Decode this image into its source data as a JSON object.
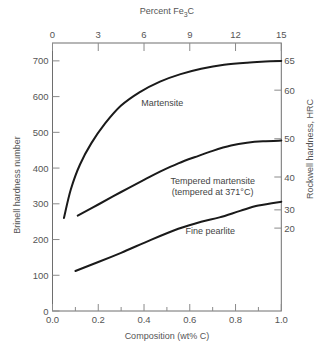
{
  "chart_data": {
    "type": "line",
    "title": "",
    "xlabel": "Composition (wt% C)",
    "ylabel": "Brinell hardness number",
    "ylabel_right": "Rockwell hardness, HRC",
    "xlabel_top": "Percent Fe3C",
    "xlim": [
      0.0,
      1.0
    ],
    "ylim": [
      0,
      750
    ],
    "x_ticks": [
      "0.0",
      "0.2",
      "0.4",
      "0.6",
      "0.8",
      "1.0"
    ],
    "x_ticks_values": [
      0.0,
      0.2,
      0.4,
      0.6,
      0.8,
      1.0
    ],
    "x_minor_ticks_values": [
      0.1,
      0.3,
      0.5,
      0.7,
      0.9
    ],
    "y_ticks": [
      "0",
      "100",
      "200",
      "300",
      "400",
      "500",
      "600",
      "700"
    ],
    "y_ticks_values": [
      0,
      100,
      200,
      300,
      400,
      500,
      600,
      700
    ],
    "top_axis": {
      "label": "Percent Fe",
      "label_sub": "3",
      "label_suffix": "C",
      "ticks": [
        "0",
        "3",
        "6",
        "9",
        "12",
        "15"
      ],
      "tick_positions_wtC": [
        0.0,
        0.2,
        0.4,
        0.6,
        0.8,
        1.0
      ]
    },
    "right_axis": {
      "label": "Rockwell hardness, HRC",
      "ticks": [
        "65",
        "60",
        "50",
        "40",
        "30",
        "20"
      ],
      "tick_positions_brinell": [
        700,
        618,
        482,
        375,
        283,
        232
      ]
    },
    "grid": false,
    "legend": "inline labels",
    "series": [
      {
        "name": "Martensite",
        "label": "Martensite",
        "label_pos": [
          0.48,
          575
        ],
        "x": [
          0.05,
          0.08,
          0.12,
          0.17,
          0.23,
          0.3,
          0.38,
          0.47,
          0.56,
          0.65,
          0.75,
          0.85,
          0.93,
          1.0
        ],
        "y": [
          260,
          340,
          410,
          470,
          525,
          575,
          612,
          642,
          663,
          678,
          689,
          695,
          698,
          700
        ]
      },
      {
        "name": "Tempered martensite (tempered at 371°C)",
        "label": "Tempered martensite",
        "label2": "(tempered at 371°C)",
        "label_pos": [
          0.7,
          355
        ],
        "x": [
          0.11,
          0.2,
          0.3,
          0.4,
          0.47,
          0.55,
          0.62,
          0.7,
          0.78,
          0.85,
          0.92,
          1.0
        ],
        "y": [
          267,
          298,
          333,
          367,
          390,
          413,
          430,
          448,
          463,
          471,
          475,
          477
        ]
      },
      {
        "name": "Fine pearlite",
        "label": "Fine pearlite",
        "label_pos": [
          0.69,
          215
        ],
        "x": [
          0.1,
          0.2,
          0.3,
          0.43,
          0.55,
          0.65,
          0.73,
          0.82,
          0.9,
          1.0
        ],
        "y": [
          112,
          137,
          163,
          199,
          230,
          250,
          262,
          280,
          295,
          306
        ]
      }
    ]
  }
}
